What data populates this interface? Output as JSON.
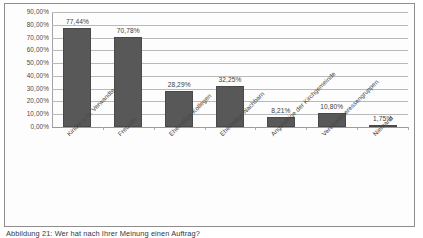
{
  "figure": {
    "caption": "Abbildung 21: Wer hat nach Ihrer Meinung einen Auftrag?",
    "frame_color": "#8e8e8e"
  },
  "chart_data": {
    "type": "bar",
    "title": "",
    "subtitle": "",
    "xlabel": "",
    "ylabel": "",
    "categories": [
      "Kinder u./o. Verwandte",
      "Freunde",
      "Ehemalige Kollegen",
      "Ehemalige Nachbarn",
      "Angehörige der Kirchgemeinde",
      "Vereine/Interessengruppen",
      "Niemand"
    ],
    "values": [
      77.44,
      70.78,
      28.29,
      32.25,
      8.21,
      10.8,
      1.75
    ],
    "value_labels": [
      "77,44%",
      "70,78%",
      "28,29%",
      "32,25%",
      "8,21%",
      "10,80%",
      "1,75%"
    ],
    "ylim": [
      0,
      90
    ],
    "ytick_values": [
      0,
      10,
      20,
      30,
      40,
      50,
      60,
      70,
      80,
      90
    ],
    "ytick_labels": [
      "0,00%",
      "10,00%",
      "20,00%",
      "30,00%",
      "40,00%",
      "50,00%",
      "60,00%",
      "70,00%",
      "80,00%",
      "90,00%"
    ],
    "grid": true,
    "legend": false,
    "legend_position": "none",
    "bar_color": "#585858",
    "gridline_color": "#b9b9b9",
    "series": [
      {
        "name": "Anteil",
        "values": [
          77.44,
          70.78,
          28.29,
          32.25,
          8.21,
          10.8,
          1.75
        ]
      }
    ]
  }
}
